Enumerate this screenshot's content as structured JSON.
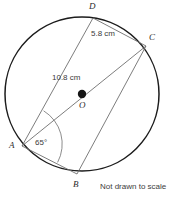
{
  "figure": {
    "type": "circle-geometry-diagram",
    "note": "Not drawn to scale",
    "circle": {
      "center_label": "O",
      "cx": 82,
      "cy": 94,
      "r": 77,
      "stroke": "#1a1a1a"
    },
    "center_dot": {
      "name": "O",
      "x": 82,
      "y": 94,
      "r": 4,
      "fill": "#1a1a1a"
    },
    "points": [
      {
        "id": "A",
        "label": "A",
        "x": 22,
        "y": 146,
        "label_x": 12,
        "label_y": 146
      },
      {
        "id": "B",
        "label": "B",
        "x": 77,
        "y": 174,
        "label_x": 74,
        "label_y": 184
      },
      {
        "id": "C",
        "label": "C",
        "x": 146,
        "y": 46,
        "label_x": 150,
        "label_y": 38
      },
      {
        "id": "D",
        "label": "D",
        "x": 93,
        "y": 18,
        "label_x": 90,
        "label_y": 5
      }
    ],
    "chords": [
      {
        "name": "chord-D-C",
        "from": "D",
        "to": "C"
      },
      {
        "name": "chord-A-D",
        "from": "A",
        "to": "D"
      },
      {
        "name": "diameter-A-C",
        "from": "A",
        "to": "C"
      },
      {
        "name": "chord-A-B",
        "from": "A",
        "to": "B"
      },
      {
        "name": "chord-B-C",
        "from": "B",
        "to": "C"
      }
    ],
    "measurements": [
      {
        "id": "DC",
        "text": "5.8 cm",
        "label_x": 92,
        "label_y": 33,
        "segment": "D to C"
      },
      {
        "id": "AC",
        "text": "10.8 cm",
        "label_x": 51,
        "label_y": 75,
        "segment": "A to C (diameter)"
      }
    ],
    "angle": {
      "id": "BAD",
      "text": "65°",
      "label_x": 35,
      "label_y": 139,
      "vertex": "A",
      "between": [
        "A to B",
        "A to D"
      ]
    }
  }
}
